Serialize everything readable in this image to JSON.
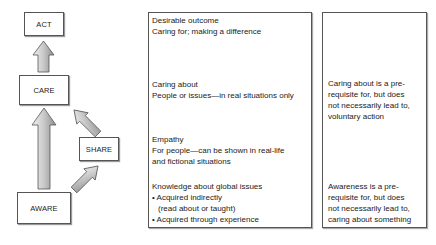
{
  "diagram": {
    "nodes": [
      {
        "id": "act",
        "label": "ACT"
      },
      {
        "id": "care",
        "label": "CARE"
      },
      {
        "id": "share",
        "label": "SHARE"
      },
      {
        "id": "aware",
        "label": "AWARE"
      }
    ],
    "edges": [
      {
        "from": "care",
        "to": "act"
      },
      {
        "from": "aware",
        "to": "care"
      },
      {
        "from": "aware",
        "to": "share"
      },
      {
        "from": "share",
        "to": "care"
      }
    ],
    "arrow_colors": {
      "fill_dark": "#9a9a9a",
      "fill_light": "#f0f0f0",
      "stroke": "#555555"
    }
  },
  "middle_panel": {
    "outcome": {
      "title": "Desirable outcome",
      "line1": "Caring for; making a difference"
    },
    "caring_about": {
      "title": "Caring about",
      "line1": "People or issues—in real situations only"
    },
    "empathy": {
      "title": "Empathy",
      "line1": "For people—can be shown in real-life",
      "line2": "and fictional situations"
    },
    "knowledge": {
      "title": "Knowledge about global issues",
      "bullet1": "• Acquired indirectly",
      "bullet1_cont": "(read about or taught)",
      "bullet2": "• Acquired through experience"
    }
  },
  "right_panel": {
    "note1": [
      "Caring about is a pre-",
      "requisite for, but does",
      "not necessarily lead to,",
      "voluntary action"
    ],
    "note2": [
      "Awareness is a pre-",
      "requisite for, but does",
      "not necessarily lead to,",
      "caring about something"
    ]
  }
}
